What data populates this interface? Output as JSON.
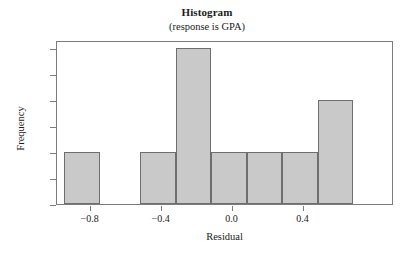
{
  "chart_data": {
    "type": "bar",
    "title": "Histogram",
    "subtitle": "(response is GPA)",
    "xlabel": "Residual",
    "ylabel": "Frequency",
    "xlim": [
      -0.99,
      0.91
    ],
    "ylim": [
      0,
      3.15
    ],
    "grid": false,
    "legend": null,
    "bin_width": 0.2,
    "bar_color": "#c9c9c9",
    "bar_edge_color": "#6e6e6e",
    "xticks": [
      -0.8,
      -0.4,
      0.0,
      0.4
    ],
    "xtick_labels": [
      "−0.8",
      "−0.4",
      "0.0",
      "0.4"
    ],
    "yticks": [
      0.0,
      0.5,
      1.0,
      1.5,
      2.0,
      2.5,
      3.0
    ],
    "ytick_labels": [
      "0.0",
      "0.5",
      "1.0",
      "1.5",
      "2.0",
      "2.5",
      "3.0"
    ],
    "bins": [
      {
        "left": -0.95,
        "right": -0.75,
        "center": -0.85,
        "frequency": 1
      },
      {
        "left": -0.52,
        "right": -0.32,
        "center": -0.42,
        "frequency": 1
      },
      {
        "left": -0.32,
        "right": -0.12,
        "center": -0.22,
        "frequency": 3
      },
      {
        "left": -0.12,
        "right": 0.08,
        "center": -0.02,
        "frequency": 1
      },
      {
        "left": 0.08,
        "right": 0.28,
        "center": 0.18,
        "frequency": 1
      },
      {
        "left": 0.28,
        "right": 0.48,
        "center": 0.38,
        "frequency": 1
      },
      {
        "left": 0.48,
        "right": 0.68,
        "center": 0.58,
        "frequency": 2
      }
    ],
    "categories": [
      "-0.85",
      "-0.42",
      "-0.22",
      "-0.02",
      "0.18",
      "0.38",
      "0.58"
    ],
    "values": [
      1,
      1,
      3,
      1,
      1,
      1,
      2
    ]
  }
}
